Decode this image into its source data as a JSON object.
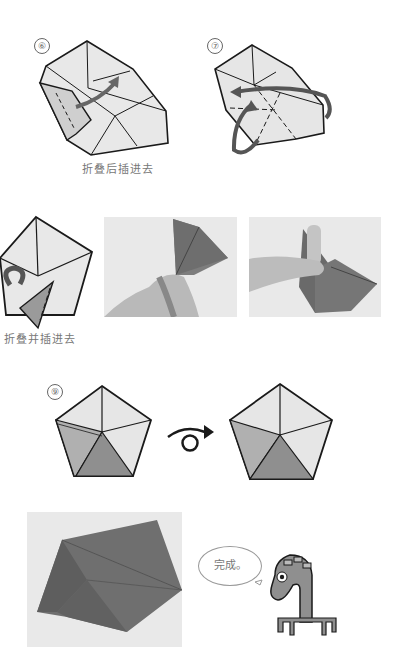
{
  "steps": [
    {
      "number": "⑥",
      "caption": "折叠后插进去"
    },
    {
      "number": "⑦",
      "caption": ""
    },
    {
      "number": "⑧",
      "caption": "折叠并插进去"
    },
    {
      "number": "⑨",
      "caption": ""
    }
  ],
  "turn_over_symbol": "turn-over",
  "finish": {
    "speech": "完成。"
  },
  "colors": {
    "line": "#1a1a1a",
    "light_face": "#e6e6e6",
    "mid_face": "#a8a8a8",
    "dark_face": "#8a8a8a",
    "arrow": "#555555"
  }
}
